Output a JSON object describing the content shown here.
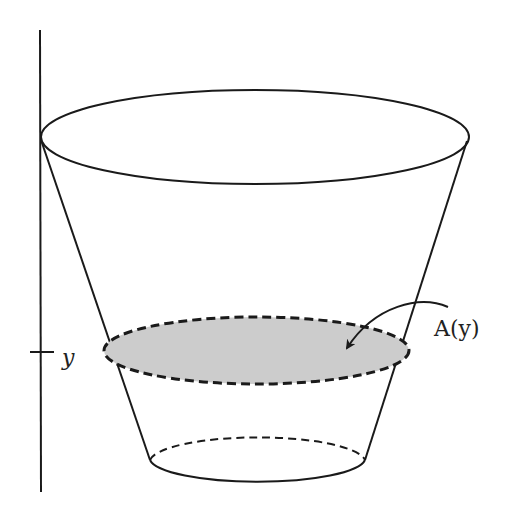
{
  "figure": {
    "labels": {
      "cross_section": "A(y)",
      "height_tick": "y"
    },
    "colors": {
      "stroke": "#1a1a1a",
      "cross_section_fill": "#cccccc",
      "background": "#ffffff"
    },
    "axis": {
      "x": 40,
      "y_top": 30,
      "y_bottom": 492,
      "tick_y": 352
    },
    "top_ellipse": {
      "cx": 255,
      "cy": 137,
      "rx": 214,
      "ry": 47
    },
    "cross_section_ellipse": {
      "cx": 256,
      "cy": 350,
      "rx": 152,
      "ry": 33
    },
    "bottom_ellipse": {
      "cx": 258,
      "cy": 459,
      "rx": 107,
      "ry": 24
    }
  }
}
